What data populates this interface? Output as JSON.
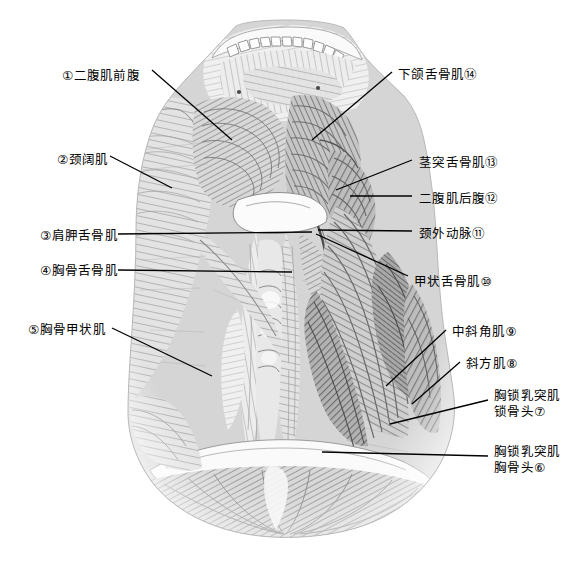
{
  "figure": {
    "type": "anatomical-illustration",
    "style": "hatched engraving, grayscale",
    "region": "颈部前面浅层及中层肌肉",
    "background_color": "#ffffff",
    "ink_color": "#000000"
  },
  "labels_left": [
    {
      "id": "1",
      "marker": "①",
      "text": "①二腹肌前腹",
      "x": 62,
      "y": 68,
      "leader": "diagonal-down-right"
    },
    {
      "id": "2",
      "marker": "②",
      "text": "②颈阔肌",
      "x": 57,
      "y": 152,
      "leader": "diagonal-down-right"
    },
    {
      "id": "3",
      "marker": "③",
      "text": "③肩胛舌骨肌",
      "x": 40,
      "y": 228,
      "leader": "horizontal-right"
    },
    {
      "id": "4",
      "marker": "④",
      "text": "④胸骨舌骨肌",
      "x": 40,
      "y": 263,
      "leader": "horizontal-right"
    },
    {
      "id": "5",
      "marker": "⑤",
      "text": "⑤胸骨甲状肌",
      "x": 28,
      "y": 322,
      "leader": "diagonal-down-right"
    }
  ],
  "labels_right": [
    {
      "id": "14",
      "marker": "⑭",
      "text": "下颌舌骨肌⑭",
      "x": 398,
      "y": 67,
      "leader": "diagonal-down-left"
    },
    {
      "id": "13",
      "marker": "⑬",
      "text": "茎突舌骨肌⑬",
      "x": 419,
      "y": 155,
      "leader": "diagonal-down-left"
    },
    {
      "id": "12",
      "marker": "⑫",
      "text": "二腹肌后腹⑫",
      "x": 419,
      "y": 191,
      "leader": "horizontal-left"
    },
    {
      "id": "11",
      "marker": "⑪",
      "text": "颈外动脉⑪",
      "x": 419,
      "y": 226,
      "leader": "horizontal-left"
    },
    {
      "id": "10",
      "marker": "⑩",
      "text": "甲状舌骨肌⑩",
      "x": 414,
      "y": 274,
      "leader": "diagonal-up-left"
    },
    {
      "id": "9",
      "marker": "⑨",
      "text": "中斜角肌⑨",
      "x": 452,
      "y": 324,
      "leader": "diagonal-down-left"
    },
    {
      "id": "8",
      "marker": "⑧",
      "text": "斜方肌⑧",
      "x": 466,
      "y": 356,
      "leader": "diagonal-down-left"
    },
    {
      "id": "7",
      "marker": "⑦",
      "text": "胸锁乳突肌\n锁骨头⑦",
      "x": 494,
      "y": 388,
      "line1": "胸锁乳突肌",
      "line2": "锁骨头⑦",
      "leader": "diagonal-down-left"
    },
    {
      "id": "6",
      "marker": "⑥",
      "text": "胸锁乳突肌\n胈骨头⑥",
      "x": 494,
      "y": 450,
      "line1": "胸锁乳突肌",
      "line2": "胸骨头⑥",
      "leader": "horizontal-left"
    }
  ],
  "structures": [
    "下颌骨与牙列",
    "二腹肌前腹",
    "颈阔肌",
    "肩胛舌骨肌",
    "胸骨舌骨肌",
    "胸骨甲状肌",
    "甲状舌骨肌",
    "颈外动脉",
    "二腹肌后腹",
    "茎突舌骨肌",
    "下颌舌骨肌",
    "中斜角肌",
    "斜方肌",
    "胸锁乳突肌锁骨头",
    "胸锁乳突肌胸骨头",
    "气管环",
    "甲状腺"
  ]
}
